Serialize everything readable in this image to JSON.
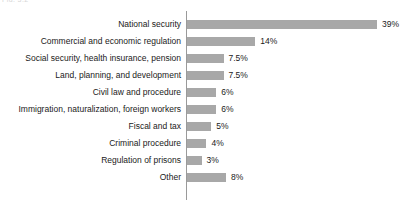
{
  "figure": {
    "caption_fragment": "Fig. 3.2",
    "axis_color": "#9a9a9a",
    "bar_color": "#a8a8a8",
    "text_color": "#1a1a1a"
  },
  "chart_data": {
    "type": "bar",
    "orientation": "horizontal",
    "title": "",
    "subtitle": "",
    "xlabel": "",
    "ylabel": "",
    "grid": false,
    "legend": null,
    "value_suffix": "%",
    "xlim": [
      0,
      39
    ],
    "categories": [
      "National security",
      "Commercial and economic regulation",
      "Social security, health insurance, pension",
      "Land, planning, and development",
      "Civil law and procedure",
      "Immigration, naturalization, foreign workers",
      "Fiscal and tax",
      "Criminal procedure",
      "Regulation of prisons",
      "Other"
    ],
    "values": [
      39,
      14,
      7.5,
      7.5,
      6,
      6,
      5,
      4,
      3,
      8
    ],
    "labels": [
      "39%",
      "14%",
      "7.5%",
      "7.5%",
      "6%",
      "6%",
      "5%",
      "4%",
      "3%",
      "8%"
    ]
  }
}
